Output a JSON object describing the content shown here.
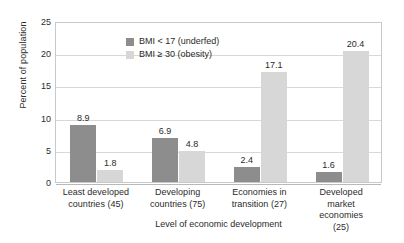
{
  "chart_data": {
    "type": "bar",
    "title": "",
    "xlabel": "Level of economic development",
    "ylabel": "Percent of population",
    "ylim": [
      0,
      25
    ],
    "yticks": [
      0,
      5,
      10,
      15,
      20,
      25
    ],
    "ytick_labels": [
      "0",
      "5",
      "10",
      "15",
      "20",
      "25"
    ],
    "grid": true,
    "legend_position": "upper-left-inside",
    "categories": [
      "Least developed countries (45)",
      "Developing countries (75)",
      "Economies in transition (27)",
      "Developed market economies (25)"
    ],
    "category_lines": [
      [
        "Least developed",
        "countries (45)"
      ],
      [
        "Developing",
        "countries (75)"
      ],
      [
        "Economies in",
        "transition (27)"
      ],
      [
        "Developed market",
        "economies (25)"
      ]
    ],
    "series": [
      {
        "name": "BMI < 17 (underfed)",
        "color": "#8d8d8d",
        "values": [
          8.9,
          6.9,
          2.4,
          1.6
        ],
        "value_labels": [
          "8.9",
          "6.9",
          "2.4",
          "1.6"
        ]
      },
      {
        "name": "BMI ≥ 30 (obesity)",
        "color": "#d7d7d7",
        "values": [
          1.8,
          4.8,
          17.1,
          20.4
        ],
        "value_labels": [
          "1.8",
          "4.8",
          "17.1",
          "20.4"
        ]
      }
    ]
  },
  "legend": {
    "items": [
      {
        "label": "BMI < 17 (underfed)",
        "color": "#8d8d8d"
      },
      {
        "label": "BMI ≥ 30 (obesity)",
        "color": "#d7d7d7"
      }
    ]
  },
  "axes": {
    "y_title": "Percent of population",
    "x_title": "Level of economic development"
  },
  "colors": {
    "underfed": "#8d8d8d",
    "obesity": "#d7d7d7",
    "gridline": "#d8d8d8",
    "frame": "#c9c9c9",
    "text": "#2b2b2b"
  }
}
